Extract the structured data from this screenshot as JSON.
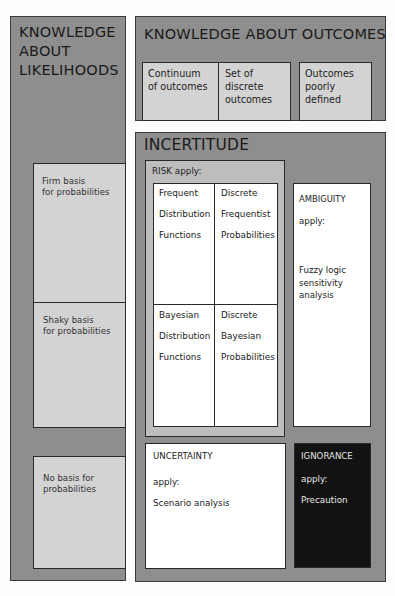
{
  "likelihoods": {
    "title_lines": [
      "KNOWLEDGE",
      "ABOUT",
      "LIKELIHOODS"
    ],
    "rows": [
      {
        "lines": [
          "Firm basis",
          "for probabilities"
        ]
      },
      {
        "lines": [
          "Shaky basis",
          "for probabilities"
        ]
      },
      {
        "lines": [
          "No basis for",
          "probabilities"
        ]
      }
    ]
  },
  "outcomes": {
    "title": "KNOWLEDGE ABOUT OUTCOMES",
    "columns": [
      {
        "lines": [
          "Continuum",
          "of outcomes"
        ]
      },
      {
        "lines": [
          "Set of",
          "discrete",
          "outcomes"
        ]
      },
      {
        "lines": [
          "Outcomes",
          "poorly",
          "defined"
        ]
      }
    ]
  },
  "incertitude": {
    "title": "INCERTITUDE",
    "risk": {
      "label": "RISK apply:",
      "cells": [
        {
          "lines": [
            "Frequent",
            "Distribution",
            "Functions"
          ]
        },
        {
          "lines": [
            "Discrete",
            "Frequentist",
            "Probabilities"
          ]
        },
        {
          "lines": [
            "Bayesian",
            "Distribution",
            "Functions"
          ]
        },
        {
          "lines": [
            "Discrete",
            "Bayesian",
            "Probabilities"
          ]
        }
      ]
    },
    "ambiguity": {
      "label": "AMBIGUITY",
      "apply": "apply:",
      "method_lines": [
        "Fuzzy logic",
        "sensitivity",
        "analysis"
      ]
    },
    "uncertainty": {
      "label": "UNCERTAINTY",
      "apply": "apply:",
      "method": "Scenario analysis"
    },
    "ignorance": {
      "label": "IGNORANCE",
      "apply": "apply:",
      "method": "Precaution"
    }
  },
  "colors": {
    "panel": "#8e8e8e",
    "light_box": "#d3d3d3",
    "white_box": "#ffffff",
    "ignorance_box": "#121212"
  }
}
